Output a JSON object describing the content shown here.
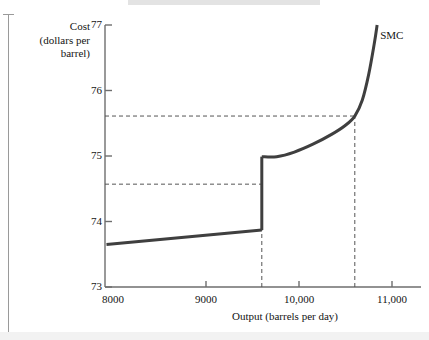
{
  "figure": {
    "series_label": "SMC",
    "y_axis_title_line1": "Cost",
    "y_axis_title_line2": "(dollars per",
    "y_axis_title_line3": "barrel)",
    "x_axis_title": "Output (barrels per day)"
  },
  "chart_data": {
    "type": "line",
    "title": "",
    "xlabel": "Output (barrels per day)",
    "ylabel": "Cost (dollars per barrel)",
    "xlim": [
      7900,
      11100
    ],
    "ylim": [
      73,
      77
    ],
    "xticks": [
      8000,
      9000,
      10000,
      11000
    ],
    "xtick_labels": [
      "8000",
      "9000",
      "10,000",
      "11,000"
    ],
    "yticks": [
      73,
      74,
      75,
      76,
      77
    ],
    "ytick_labels": [
      "73",
      "74",
      "75",
      "76",
      "77"
    ],
    "grid": false,
    "legend": "none",
    "series": [
      {
        "name": "SMC",
        "label_position": {
          "x": 10830,
          "y": 76.84
        },
        "color": "#3f3f3f",
        "line_width": 3,
        "discontinuous": true,
        "segments": [
          {
            "name": "pre-jump-segment",
            "points": [
              {
                "x": 7930,
                "y": 73.65
              },
              {
                "x": 9600,
                "y": 73.87
              }
            ]
          },
          {
            "name": "vertical-jump",
            "points": [
              {
                "x": 9600,
                "y": 73.87
              },
              {
                "x": 9600,
                "y": 74.99
              }
            ]
          },
          {
            "name": "post-jump-rising-segment",
            "points": [
              {
                "x": 9600,
                "y": 74.99
              },
              {
                "x": 9760,
                "y": 74.99
              },
              {
                "x": 9950,
                "y": 75.06
              },
              {
                "x": 10150,
                "y": 75.18
              },
              {
                "x": 10350,
                "y": 75.33
              },
              {
                "x": 10500,
                "y": 75.47
              },
              {
                "x": 10600,
                "y": 75.61
              },
              {
                "x": 10680,
                "y": 75.85
              },
              {
                "x": 10750,
                "y": 76.25
              },
              {
                "x": 10810,
                "y": 76.72
              },
              {
                "x": 10840,
                "y": 77.0
              }
            ]
          }
        ]
      }
    ],
    "annotations": [
      {
        "name": "upper-price-guide",
        "type": "dashed-horizontal",
        "y": 75.61,
        "x_from": 7900,
        "x_to": 10600
      },
      {
        "name": "lower-price-guide",
        "type": "dashed-horizontal",
        "y": 74.57,
        "x_from": 7900,
        "x_to": 9600
      },
      {
        "name": "lower-quantity-guide",
        "type": "dashed-vertical",
        "x": 9600,
        "y_from": 73,
        "y_to": 74.99
      },
      {
        "name": "upper-quantity-guide",
        "type": "dashed-vertical",
        "x": 10600,
        "y_from": 73,
        "y_to": 75.61
      }
    ],
    "colors": {
      "curve": "#3f3f3f",
      "axis": "#6e6e6e",
      "dashed_guide": "#555555",
      "text": "#141414"
    }
  }
}
